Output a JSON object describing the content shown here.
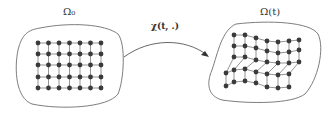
{
  "diagram": {
    "left_domain": {
      "label": "Ω₀",
      "grid": {
        "cols": 7,
        "rows": 5
      }
    },
    "right_domain": {
      "label": "Ω(t)",
      "grid": {
        "cols": 7,
        "rows": 5,
        "deformed": true
      }
    },
    "mapping": {
      "label": "χ(t, .)"
    },
    "colors": {
      "outline": "#6e6e6e",
      "node": "#3a3a3a",
      "edge": "#7a7a7a",
      "arrow": "#555555"
    }
  }
}
